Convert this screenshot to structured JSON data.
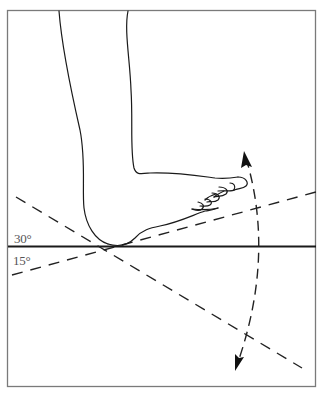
{
  "figure": {
    "labels": {
      "upper_angle": "30°",
      "lower_angle": "15°"
    },
    "colors": {
      "background": "#ffffff",
      "frame": "#777777",
      "lines": "#222222",
      "label_text": "#555555"
    },
    "elements": {
      "frame": "rectangular border",
      "horizontal_reference_line": "solid line (neutral ground plane)",
      "dashed_line_30": "dashed line descending left-to-right at ~30° (plantarflexion)",
      "dashed_line_15": "dashed line ascending left-to-right at ~15° (dorsiflexion)",
      "motion_arc": "dashed double-headed arc arrow near toes",
      "foot": "outline drawing of lower leg and foot"
    }
  }
}
